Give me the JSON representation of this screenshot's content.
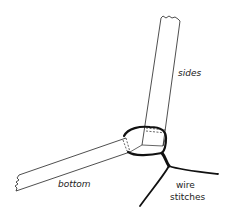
{
  "diagram": {
    "title": "",
    "labels": {
      "sides": "sides",
      "bottom": "bottom",
      "wire_line1": "wire",
      "wire_line2": "stitches"
    },
    "colors": {
      "line": "#222222",
      "wire": "#111111",
      "background": "#ffffff"
    }
  }
}
